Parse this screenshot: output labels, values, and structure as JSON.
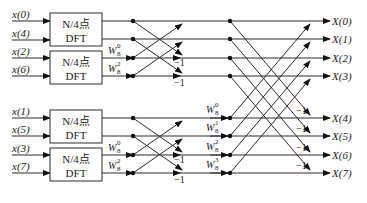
{
  "diagram": {
    "type": "8-point DIT FFT flow graph (decomposed into four N/4-point DFTs)",
    "inputs": [
      "x(0)",
      "x(4)",
      "x(2)",
      "x(6)",
      "x(1)",
      "x(5)",
      "x(3)",
      "x(7)"
    ],
    "outputs": [
      "X(0)",
      "X(1)",
      "X(2)",
      "X(3)",
      "X(4)",
      "X(5)",
      "X(6)",
      "X(7)"
    ],
    "blocks": [
      {
        "line1": "N/4点",
        "line2": "DFT"
      },
      {
        "line1": "N/4点",
        "line2": "DFT"
      },
      {
        "line1": "N/4点",
        "line2": "DFT"
      },
      {
        "line1": "N/4点",
        "line2": "DFT"
      }
    ],
    "stage1_twiddles": {
      "upper": [
        {
          "base": "W",
          "sup": "0",
          "sub": "8"
        },
        {
          "base": "W",
          "sup": "2",
          "sub": "8"
        }
      ],
      "lower": [
        {
          "base": "W",
          "sup": "0",
          "sub": "8"
        },
        {
          "base": "W",
          "sup": "2",
          "sub": "8"
        }
      ]
    },
    "stage2_twiddles": [
      {
        "base": "W",
        "sup": "0",
        "sub": "8"
      },
      {
        "base": "W",
        "sup": "1",
        "sub": "8"
      },
      {
        "base": "W",
        "sup": "2",
        "sub": "8"
      },
      {
        "base": "W",
        "sup": "3",
        "sub": "8"
      }
    ],
    "minus_one": "−1"
  }
}
